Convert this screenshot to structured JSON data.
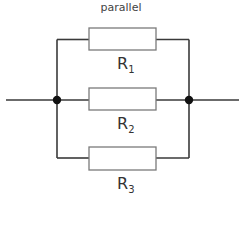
{
  "diagram": {
    "title": "parallel",
    "type": "parallel-resistor-circuit",
    "colors": {
      "wire": "#3a3a3a",
      "resistor_outline": "#777777",
      "node": "#111111",
      "text": "#333333"
    },
    "resistors": [
      {
        "id": "R1",
        "letter": "R",
        "subscript": "1"
      },
      {
        "id": "R2",
        "letter": "R",
        "subscript": "2"
      },
      {
        "id": "R3",
        "letter": "R",
        "subscript": "3"
      }
    ],
    "nodes": [
      "left-junction",
      "right-junction"
    ]
  }
}
